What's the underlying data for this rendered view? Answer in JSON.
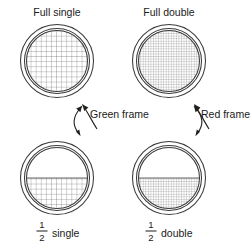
{
  "figure": {
    "background_color": "#ffffff",
    "line_color": "#3a3a3a",
    "mesh_color": "#6e6e6e"
  },
  "panels": [
    {
      "id": "full-single",
      "label": "Full single",
      "mesh": "single",
      "fill": "full",
      "position": "top-left"
    },
    {
      "id": "full-double",
      "label": "Full double",
      "mesh": "double",
      "fill": "full",
      "position": "top-right"
    },
    {
      "id": "half-single",
      "label_numerator": "1",
      "label_denominator": "2",
      "label_suffix": "single",
      "mesh": "single",
      "fill": "half",
      "position": "bottom-left"
    },
    {
      "id": "half-double",
      "label_numerator": "1",
      "label_denominator": "2",
      "label_suffix": "double",
      "mesh": "double",
      "fill": "half",
      "position": "bottom-right"
    }
  ],
  "annotations": {
    "left_frame_label": "Green frame",
    "right_frame_label": "Red frame"
  }
}
